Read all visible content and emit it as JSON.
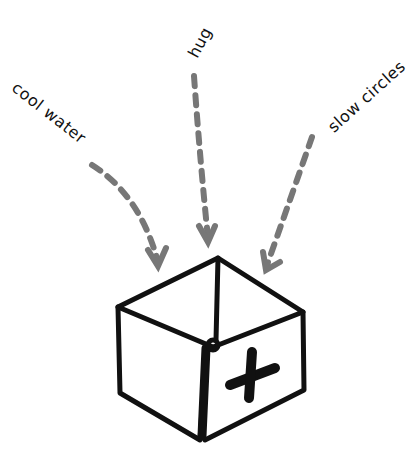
{
  "diagram": {
    "labels": [
      {
        "id": "cool-water",
        "text": "cool water"
      },
      {
        "id": "hug",
        "text": "hug"
      },
      {
        "id": "slow-circles",
        "text": "slow circles"
      }
    ],
    "box": {
      "symbol": "plus",
      "description": "open box with plus sign"
    },
    "colors": {
      "arrow": "#777777",
      "ink": "#111111",
      "background": "#ffffff"
    }
  }
}
